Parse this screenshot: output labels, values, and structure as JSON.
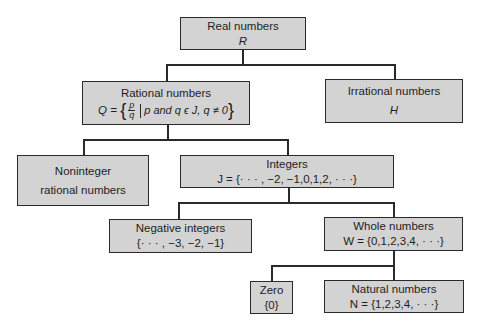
{
  "diagram": {
    "type": "hierarchy-tree",
    "nodes": {
      "real": {
        "label": "Real numbers",
        "symbol": "R"
      },
      "rational": {
        "label": "Rational numbers",
        "symbol": "Q",
        "definition_prefix": "Q =",
        "frac_num": "p",
        "frac_den": "q",
        "condition": "p and q ϵ J, q ≠ 0"
      },
      "irrational": {
        "label": "Irrational numbers",
        "symbol": "H"
      },
      "noninteger": {
        "label_line1": "Noninteger",
        "label_line2": "rational numbers"
      },
      "integers": {
        "label": "Integers",
        "definition": "J = {· · · , −2, −1,0,1,2, · · ·}"
      },
      "negative": {
        "label": "Negative integers",
        "definition": "{· · · , −3, −2, −1}"
      },
      "whole": {
        "label": "Whole numbers",
        "definition": "W = {0,1,2,3,4, · · ·}"
      },
      "zero": {
        "label": "Zero",
        "definition": "{0}"
      },
      "natural": {
        "label": "Natural numbers",
        "definition": "N = {1,2,3,4, · · ·}"
      }
    },
    "edges": [
      [
        "real",
        "rational"
      ],
      [
        "real",
        "irrational"
      ],
      [
        "rational",
        "noninteger"
      ],
      [
        "rational",
        "integers"
      ],
      [
        "integers",
        "negative"
      ],
      [
        "integers",
        "whole"
      ],
      [
        "whole",
        "zero"
      ],
      [
        "whole",
        "natural"
      ]
    ],
    "colors": {
      "box_fill": "#d3d3d3",
      "line": "#2a2a2a",
      "background": "#ffffff"
    }
  }
}
